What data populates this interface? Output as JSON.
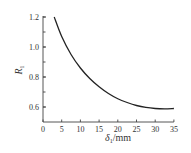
{
  "chart_data": {
    "type": "line",
    "title": "",
    "xlabel": "δ1/mm",
    "ylabel": "R1",
    "xlim": [
      0,
      35
    ],
    "ylim": [
      0.5,
      1.2
    ],
    "grid": false,
    "x_ticks": [
      "0",
      "5",
      "10",
      "15",
      "20",
      "25",
      "30",
      "35"
    ],
    "y_ticks": [
      "0.6",
      "0.8",
      "1.0",
      "1.2"
    ],
    "series": [
      {
        "name": "R1",
        "x": [
          3,
          5,
          7.5,
          10,
          12.5,
          15,
          17.5,
          20,
          22.5,
          25,
          27.5,
          30,
          32.5,
          35
        ],
        "y": [
          1.2,
          1.07,
          0.95,
          0.86,
          0.79,
          0.735,
          0.69,
          0.655,
          0.63,
          0.61,
          0.597,
          0.59,
          0.588,
          0.59
        ]
      }
    ]
  }
}
